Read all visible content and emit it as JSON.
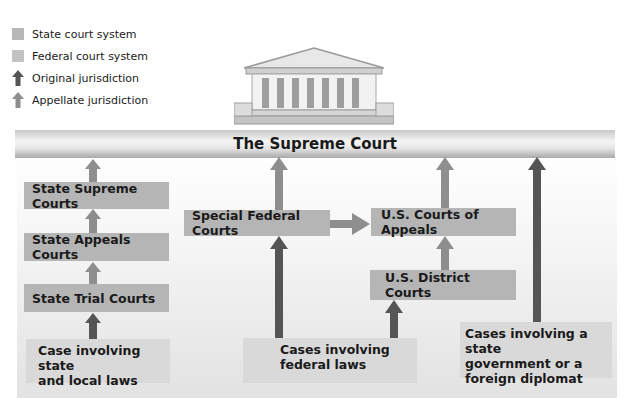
{
  "legend": [
    {
      "label": "State court system",
      "kind": "swatch",
      "color": "#b8b8b8",
      "icon": "state-swatch"
    },
    {
      "label": "Federal court system",
      "kind": "swatch",
      "color": "#c2c2c2",
      "icon": "federal-swatch"
    },
    {
      "label": "Original jurisdiction",
      "kind": "arrow",
      "color": "#555555",
      "icon": "original-arrow-icon"
    },
    {
      "label": "Appellate jurisdiction",
      "kind": "arrow",
      "color": "#8e8e8e",
      "icon": "appellate-arrow-icon"
    }
  ],
  "supreme_court": {
    "label": "The Supreme Court",
    "icon": "courthouse-icon"
  },
  "state_courts": {
    "supreme": "State Supreme Courts",
    "appeals": "State Appeals Courts",
    "trial": "State Trial Courts"
  },
  "federal_courts": {
    "special": "Special Federal Courts",
    "appeals": "U.S. Courts of Appeals",
    "district": "U.S. District Courts"
  },
  "cases": {
    "state_local": [
      "Case involving state",
      "and local laws"
    ],
    "federal": [
      "Cases involving",
      "federal laws"
    ],
    "state_diplomat": [
      "Cases involving a state",
      "government or a",
      "foreign diplomat"
    ]
  },
  "colors": {
    "original": "#555555",
    "appellate": "#8e8e8e",
    "box": "#b5b5b5",
    "case_bg": "#d9d9d9"
  }
}
